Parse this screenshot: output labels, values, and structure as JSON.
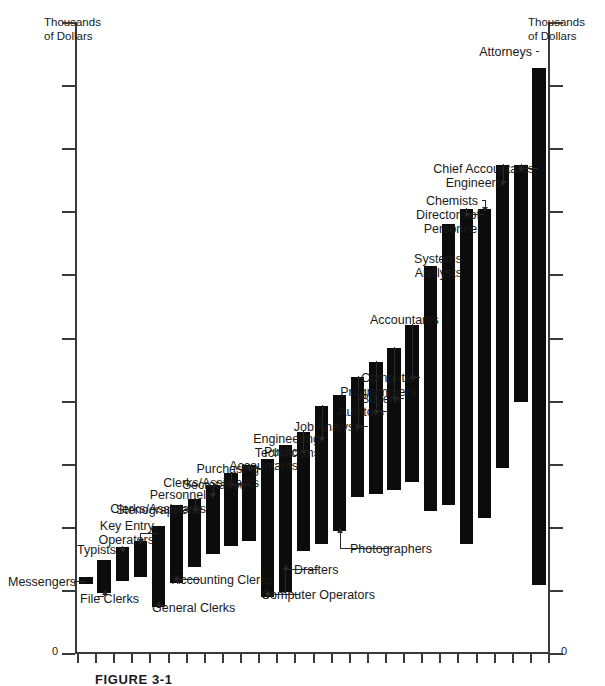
{
  "figure": {
    "caption": "FIGURE 3-1",
    "axis_title_left": "Thousands\nof Dollars",
    "axis_title_right": "Thousands\nof Dollars",
    "zero_left": "0",
    "zero_right": "0"
  },
  "chart_data": {
    "type": "bar",
    "subtype": "floating-range-bar",
    "title": "",
    "xlabel": "",
    "ylabel": "Thousands of Dollars",
    "grid": false,
    "legend": false,
    "axis_tick_labels_y": [
      "0"
    ],
    "note": "Horizontal floating bars: each occupation spans a salary range (bar bottom = minimum, bar top = maximum), ordered left-to-right from lowest to highest paid. Y values are in thousands of dollars, estimated from unlabeled evenly spaced ticks (one tick = 5 units).",
    "ytick_count": 11,
    "ylim": [
      0,
      55
    ],
    "categories": [
      "Messengers",
      "File Clerks",
      "Typists",
      "Key Entry Operators",
      "General Clerks",
      "Accounting Clerks",
      "Stenographers",
      "Personnel Clerks/Assistants",
      "Secretaries",
      "Purchasing Clerks/Assistants",
      "Computer Operators",
      "Drafters",
      "Public Accountants",
      "Engineering Technicians",
      "Photographers",
      "Job Analysts",
      "Auditors",
      "Buyers",
      "Computer Programmers",
      "Accountants",
      "Systems Analysts",
      "Directors of Personnel",
      "Chemists",
      "Engineers",
      "Chief Accountants",
      "Attorneys"
    ],
    "range_low": [
      6.0,
      5.2,
      6.3,
      6.6,
      4.0,
      6.1,
      7.5,
      8.6,
      9.3,
      9.8,
      4.9,
      5.3,
      8.9,
      9.5,
      10.6,
      13.6,
      13.9,
      14.2,
      14.9,
      12.4,
      12.9,
      9.5,
      11.8,
      16.1,
      21.9,
      5.9
    ],
    "range_high": [
      6.6,
      8.1,
      9.2,
      9.8,
      11.1,
      12.9,
      13.4,
      14.6,
      15.7,
      16.4,
      16.9,
      18.1,
      19.3,
      21.5,
      22.5,
      24.1,
      25.4,
      26.6,
      28.6,
      33.7,
      37.4,
      38.7,
      38.7,
      42.5,
      42.5,
      51.0
    ],
    "labels_with_leaders": [
      "Messengers",
      "File Clerks",
      "Typists",
      "Key Entry Operators",
      "General Clerks",
      "Accounting Clerks",
      "Stenographers",
      "Personnel Clerks/Assistants",
      "Secretaries",
      "Purchasing Clerks/Assistants",
      "Computer Operators",
      "Drafters",
      "Public Accountants",
      "Engineering Technicians",
      "Photographers",
      "Job Analysts",
      "Auditors",
      "Buyers",
      "Computer Programmers",
      "Directors of Personnel",
      "Chemists",
      "Engineers",
      "Chief Accountants",
      "Attorneys"
    ],
    "labels_without_leaders": [
      "Accountants",
      "Systems Analysts"
    ]
  },
  "labels": {
    "messengers": "Messengers",
    "file_clerks": "File Clerks",
    "typists": "Typists",
    "key_entry_operators": "Key Entry\nOperators",
    "general_clerks": "General Clerks",
    "accounting_clerks": "Accounting Clerks",
    "stenographers": "Stenographers",
    "personnel_clerks": "Personnel Clerks/Assistants",
    "secretaries": "Secretaries",
    "purchasing_clerks": "Purchasing Clerks/Assistants",
    "computer_operators": "Computer Operators",
    "drafters": "Drafters",
    "public_accountants": "Public Accountants",
    "engineering_technicians": "Engineering Technicians",
    "photographers": "Photographers",
    "job_analysts": "Job Analysts",
    "auditors": "Auditors",
    "buyers": "Buyers",
    "computer_programmers": "Computer Programmers",
    "accountants": "Accountants",
    "systems_analysts": "Systems Analysts",
    "directors_of_personnel": "Directors of Personnel",
    "chemists": "Chemists",
    "engineers": "Engineers",
    "chief_accountants": "Chief Accountants",
    "attorneys": "Attorneys"
  }
}
